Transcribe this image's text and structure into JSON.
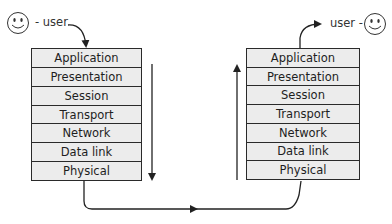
{
  "diagram": {
    "type": "OSI model data flow",
    "sender": {
      "label": "- user",
      "icon": "smiley-face-icon",
      "direction": "down",
      "layers": [
        "Application",
        "Presentation",
        "Session",
        "Transport",
        "Network",
        "Data link",
        "Physical"
      ]
    },
    "receiver": {
      "label": "user -",
      "icon": "smiley-face-icon",
      "direction": "up",
      "layers": [
        "Application",
        "Presentation",
        "Session",
        "Transport",
        "Network",
        "Data link",
        "Physical"
      ]
    },
    "colors": {
      "layer_fill": "#ececec",
      "stroke": "#2a2a2a",
      "background": "#ffffff"
    }
  }
}
